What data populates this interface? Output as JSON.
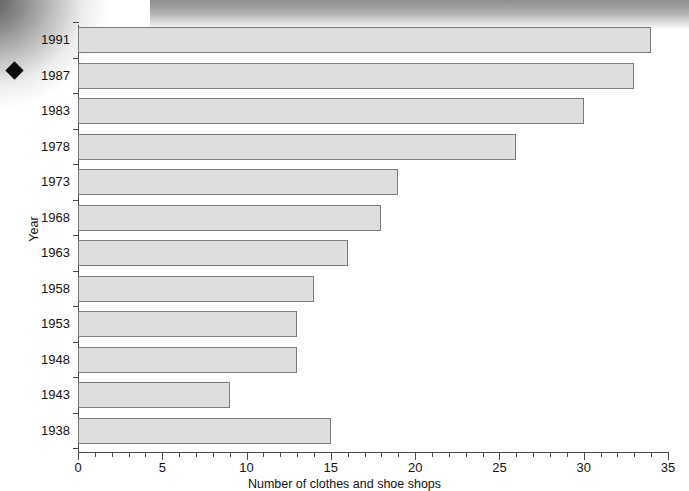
{
  "chart_data": {
    "type": "bar",
    "orientation": "horizontal",
    "title": "",
    "xlabel": "Number of clothes and shoe shops",
    "ylabel": "Year",
    "categories": [
      "1991",
      "1987",
      "1983",
      "1978",
      "1973",
      "1968",
      "1963",
      "1958",
      "1953",
      "1948",
      "1943",
      "1938"
    ],
    "values": [
      34,
      33,
      30,
      26,
      19,
      18,
      16,
      14,
      13,
      13,
      9,
      15
    ],
    "xlim": [
      0,
      35
    ],
    "xticks": [
      0,
      5,
      10,
      15,
      20,
      25,
      30,
      35
    ],
    "xtick_labels": [
      "0",
      "5",
      "10",
      "15",
      "20",
      "25",
      "30",
      "35"
    ],
    "x_minor_tick_step": 1,
    "grid": false,
    "legend": false,
    "bar_fill_color": "#dedede",
    "bar_border_color": "#7b7b7b",
    "axis_color": "#4a4a4a",
    "text_color": "#111111"
  },
  "artifacts": {
    "page_marker": "diamond-marker",
    "scan_shadow_top": "scan-shadow-gradient",
    "scan_shadow_corner": "scan-shadow-corner-gradient"
  }
}
